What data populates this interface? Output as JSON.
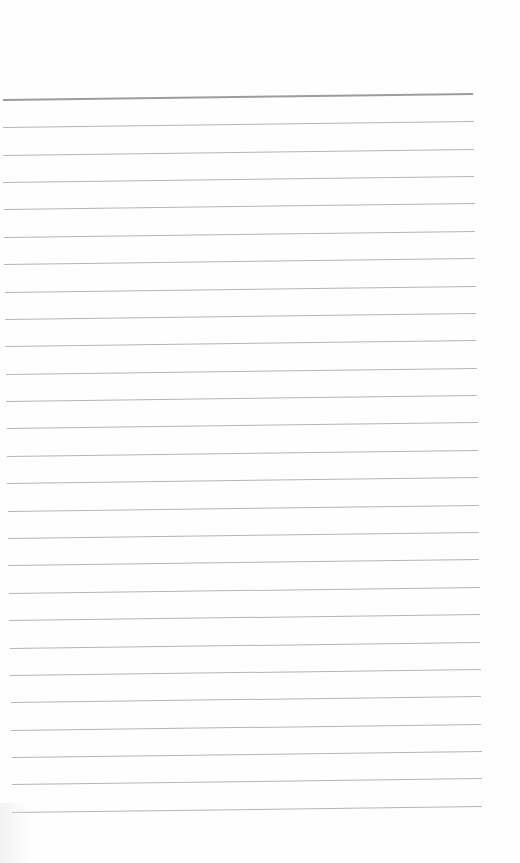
{
  "document": {
    "type": "lined-paper",
    "background_color": "#fefefe",
    "header_rule_color": "#9c9c9c",
    "rule_color": "#b4b4b4",
    "header_rule": {
      "x1": 3,
      "y1": 99,
      "x2": 473,
      "y2": 93
    },
    "rules": [
      {
        "x1": 3,
        "y1": 127,
        "x2": 474,
        "y2": 121
      },
      {
        "x1": 3,
        "y1": 155,
        "x2": 474,
        "y2": 149
      },
      {
        "x1": 3,
        "y1": 182,
        "x2": 474,
        "y2": 176
      },
      {
        "x1": 4,
        "y1": 209,
        "x2": 475,
        "y2": 203
      },
      {
        "x1": 4,
        "y1": 237,
        "x2": 475,
        "y2": 231
      },
      {
        "x1": 4,
        "y1": 264,
        "x2": 475,
        "y2": 258
      },
      {
        "x1": 5,
        "y1": 292,
        "x2": 476,
        "y2": 286
      },
      {
        "x1": 5,
        "y1": 319,
        "x2": 476,
        "y2": 313
      },
      {
        "x1": 5,
        "y1": 346,
        "x2": 476,
        "y2": 340
      },
      {
        "x1": 6,
        "y1": 374,
        "x2": 477,
        "y2": 368
      },
      {
        "x1": 6,
        "y1": 401,
        "x2": 477,
        "y2": 395
      },
      {
        "x1": 7,
        "y1": 428,
        "x2": 478,
        "y2": 422
      },
      {
        "x1": 7,
        "y1": 456,
        "x2": 478,
        "y2": 450
      },
      {
        "x1": 7,
        "y1": 483,
        "x2": 478,
        "y2": 477
      },
      {
        "x1": 8,
        "y1": 511,
        "x2": 479,
        "y2": 505
      },
      {
        "x1": 8,
        "y1": 538,
        "x2": 479,
        "y2": 532
      },
      {
        "x1": 8,
        "y1": 565,
        "x2": 479,
        "y2": 559
      },
      {
        "x1": 9,
        "y1": 593,
        "x2": 480,
        "y2": 587
      },
      {
        "x1": 9,
        "y1": 620,
        "x2": 480,
        "y2": 614
      },
      {
        "x1": 10,
        "y1": 648,
        "x2": 480,
        "y2": 642
      },
      {
        "x1": 10,
        "y1": 675,
        "x2": 481,
        "y2": 669
      },
      {
        "x1": 11,
        "y1": 702,
        "x2": 481,
        "y2": 696
      },
      {
        "x1": 11,
        "y1": 730,
        "x2": 481,
        "y2": 724
      },
      {
        "x1": 12,
        "y1": 757,
        "x2": 482,
        "y2": 751
      },
      {
        "x1": 12,
        "y1": 784,
        "x2": 482,
        "y2": 778
      },
      {
        "x1": 12,
        "y1": 812,
        "x2": 482,
        "y2": 806
      }
    ]
  }
}
